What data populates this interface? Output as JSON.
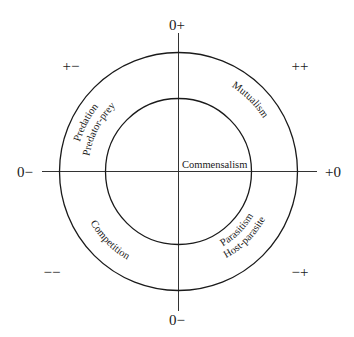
{
  "geometry": {
    "cx": 178.5,
    "cy": 171.5,
    "outer_r": 119,
    "inner_r": 73
  },
  "colors": {
    "ink": "#1a1a1a",
    "axis": "#333333",
    "background": "#ffffff"
  },
  "axis_labels": {
    "top": "0+",
    "bottom": "0−",
    "left": "0−",
    "right": "+0"
  },
  "quadrant_labels": {
    "top_left": "+−",
    "top_right": "++",
    "bottom_left": "−−",
    "bottom_right": "−+"
  },
  "center_label": "Commensalism",
  "ring_labels": {
    "top_left": [
      "Predation",
      "Predator-prey"
    ],
    "top_right": [
      "Mutualism"
    ],
    "bottom_left": [
      "Competition"
    ],
    "bottom_right": [
      "Parasitism",
      "Host-parasite"
    ]
  }
}
